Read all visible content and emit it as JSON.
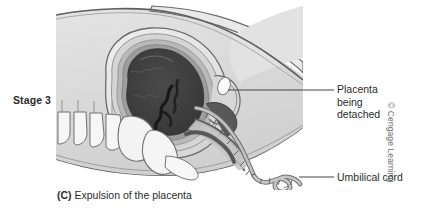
{
  "figure": {
    "stage_label": "Stage 3",
    "caption_tag": "(C)",
    "caption_text": "Expulsion of the placenta",
    "copyright": "© Cengage Learning"
  },
  "labels": [
    {
      "id": "placenta",
      "text": "Placenta being detached",
      "line_1": "Placenta",
      "line_2": "being",
      "line_3": "detached"
    },
    {
      "id": "umbilical-cord",
      "text": "Umbilical cord"
    }
  ],
  "colors": {
    "background": "#ffffff",
    "body_fill": "#dcdcdc",
    "body_light": "#e9e9e9",
    "uterus_wall": "#e6e6e6",
    "uterus_mid": "#c9c9c9",
    "uterus_ring": "#9a9a9a",
    "placenta_dark": "#3c3c3c",
    "placenta_shadow": "#555555",
    "bone_fill": "#f4f4f4",
    "outline": "#5a5a5a",
    "outline_dark": "#444444",
    "cord_fill": "#b6b6b6",
    "leader_line": "#444444",
    "text": "#2b2b2b",
    "copyright_text": "#6f6f6f"
  },
  "anatomy": {
    "parts": [
      "maternal-body-outline",
      "uterus-wall",
      "uterine-cavity",
      "detached-placenta",
      "cervix",
      "vagina",
      "sacrum-vertebrae",
      "pubic-bone",
      "umbilical-cord"
    ]
  }
}
